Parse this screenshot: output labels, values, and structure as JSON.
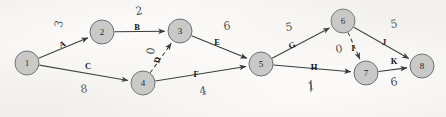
{
  "diagram": {
    "type": "directed-weighted-graph",
    "title": "",
    "nodes": [
      {
        "id": "1",
        "label": "1",
        "cx": 27,
        "cy": 63,
        "r": 12
      },
      {
        "id": "2",
        "label": "2",
        "cx": 102,
        "cy": 32,
        "r": 12
      },
      {
        "id": "3",
        "label": "3",
        "cx": 180,
        "cy": 31,
        "r": 12
      },
      {
        "id": "4",
        "label": "4",
        "cx": 143,
        "cy": 83,
        "r": 12
      },
      {
        "id": "5",
        "label": "5",
        "cx": 261,
        "cy": 64,
        "r": 12
      },
      {
        "id": "6",
        "label": "6",
        "cx": 343,
        "cy": 21,
        "r": 12
      },
      {
        "id": "7",
        "label": "7",
        "cx": 366,
        "cy": 73,
        "r": 12
      },
      {
        "id": "8",
        "label": "8",
        "cx": 422,
        "cy": 66,
        "r": 12
      }
    ],
    "edges": [
      {
        "id": "A",
        "name": "A",
        "weight": "3",
        "from": "1",
        "to": "2",
        "style": "solid",
        "name_x": 62,
        "name_y": 44,
        "name_rot": -24,
        "weight_x": 59,
        "weight_y": 24,
        "weight_rot": -68,
        "tick_x1": 0,
        "tick_y1": 0,
        "tick_x2": 0,
        "tick_y2": 0
      },
      {
        "id": "B",
        "name": "B",
        "weight": "2",
        "from": "2",
        "to": "3",
        "style": "solid",
        "name_x": 137,
        "name_y": 27,
        "name_rot": 0,
        "weight_x": 139,
        "weight_y": 11,
        "weight_rot": 0,
        "tick_x1": 0,
        "tick_y1": 0,
        "tick_x2": 0,
        "tick_y2": 0
      },
      {
        "id": "C",
        "name": "C",
        "weight": "8",
        "from": "1",
        "to": "4",
        "style": "solid",
        "name_x": 88,
        "name_y": 66,
        "name_rot": 0,
        "weight_x": 84,
        "weight_y": 89,
        "weight_rot": 0,
        "tick_x1": 0,
        "tick_y1": 0,
        "tick_x2": 0,
        "tick_y2": 0
      },
      {
        "id": "D",
        "name": "D",
        "weight": "0",
        "from": "4",
        "to": "3",
        "style": "dashed",
        "name_x": 157,
        "name_y": 60,
        "name_rot": -74,
        "weight_x": 151,
        "weight_y": 51,
        "weight_rot": -74,
        "tick_x1": 0,
        "tick_y1": 0,
        "tick_x2": 0,
        "tick_y2": 0
      },
      {
        "id": "E",
        "name": "E",
        "weight": "6",
        "from": "3",
        "to": "5",
        "style": "solid",
        "name_x": 217,
        "name_y": 42,
        "name_rot": 0,
        "weight_x": 227,
        "weight_y": 26,
        "weight_rot": 0,
        "tick_x1": 0,
        "tick_y1": 0,
        "tick_x2": 0,
        "tick_y2": 0
      },
      {
        "id": "F",
        "name": "F",
        "weight": "4",
        "from": "4",
        "to": "5",
        "style": "solid",
        "name_x": 196,
        "name_y": 74,
        "name_rot": 0,
        "weight_x": 203,
        "weight_y": 91,
        "weight_rot": 0,
        "tick_x1": 0,
        "tick_y1": 0,
        "tick_x2": 0,
        "tick_y2": 0
      },
      {
        "id": "G",
        "name": "G",
        "weight": "5",
        "from": "5",
        "to": "6",
        "style": "solid",
        "name_x": 292,
        "name_y": 45,
        "name_rot": -26,
        "weight_x": 289,
        "weight_y": 27,
        "weight_rot": 0,
        "tick_x1": 0,
        "tick_y1": 0,
        "tick_x2": 0,
        "tick_y2": 0
      },
      {
        "id": "H",
        "name": "H",
        "weight": "1",
        "from": "5",
        "to": "7",
        "style": "solid",
        "name_x": 314,
        "name_y": 67,
        "name_rot": 0,
        "weight_x": 311,
        "weight_y": 86,
        "weight_rot": 0,
        "tick_x1": 311,
        "tick_y1": 80,
        "tick_x2": 311,
        "tick_y2": 92
      },
      {
        "id": "I",
        "name": "I",
        "weight": "0",
        "from": "6",
        "to": "7",
        "style": "dashed",
        "name_x": 353,
        "name_y": 48,
        "name_rot": 0,
        "weight_x": 339,
        "weight_y": 49,
        "weight_rot": 0,
        "tick_x1": 0,
        "tick_y1": 0,
        "tick_x2": 0,
        "tick_y2": 0
      },
      {
        "id": "J",
        "name": "J",
        "weight": "5",
        "from": "6",
        "to": "8",
        "style": "solid",
        "name_x": 384,
        "name_y": 42,
        "name_rot": 0,
        "weight_x": 394,
        "weight_y": 24,
        "weight_rot": 0,
        "tick_x1": 0,
        "tick_y1": 0,
        "tick_x2": 0,
        "tick_y2": 0
      },
      {
        "id": "K",
        "name": "K",
        "weight": "6",
        "from": "7",
        "to": "8",
        "style": "solid",
        "name_x": 394,
        "name_y": 61,
        "name_rot": 0,
        "weight_x": 394,
        "weight_y": 82,
        "weight_rot": 0,
        "tick_x1": 0,
        "tick_y1": 0,
        "tick_x2": 0,
        "tick_y2": 0
      }
    ]
  }
}
